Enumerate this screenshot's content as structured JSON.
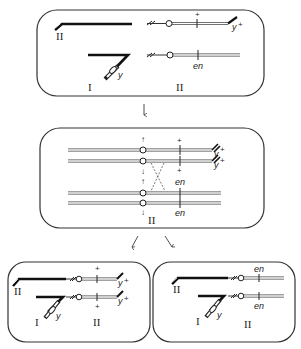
{
  "diagram": {
    "type": "chromosome-translocation-recombination",
    "panels": [
      {
        "id": "top",
        "labels": {
          "het_II": "II",
          "chrom_I": "I",
          "chrom_II": "II",
          "gene_y_plus": "y",
          "plus_superscript": "+",
          "marker_plus": "+",
          "gene_en": "en",
          "gene_y": "y"
        }
      },
      {
        "id": "middle",
        "labels": {
          "chrom_II": "II",
          "gene_y_plus_1": "y",
          "gene_y_plus_2": "y",
          "plus_superscript": "+",
          "marker_plus_1": "+",
          "marker_plus_2": "+",
          "gene_en_1": "en",
          "gene_en_2": "en",
          "arrow_up": "↑",
          "arrow_down": "↓"
        }
      },
      {
        "id": "bottom-left",
        "labels": {
          "het_II": "II",
          "chrom_I": "I",
          "chrom_II": "II",
          "gene_y": "y",
          "gene_y_plus_1": "y",
          "gene_y_plus_2": "y",
          "plus_superscript": "+",
          "marker_plus_1": "+",
          "marker_plus_2": "+"
        }
      },
      {
        "id": "bottom-right",
        "labels": {
          "het_II": "II",
          "chrom_I": "I",
          "chrom_II": "II",
          "gene_y": "y",
          "gene_en_1": "en",
          "gene_en_2": "en"
        }
      }
    ],
    "flow_arrows": [
      "top-to-middle",
      "middle-to-bottom-left",
      "middle-to-bottom-right"
    ]
  }
}
